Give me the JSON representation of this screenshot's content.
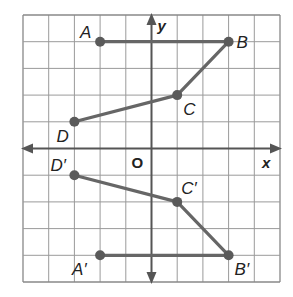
{
  "diagram": {
    "type": "coordinate-grid-reflection",
    "grid": {
      "xmin": -5,
      "xmax": 5,
      "ymin": -5,
      "ymax": 5,
      "step": 1
    },
    "axes": {
      "x_label": "x",
      "y_label": "y",
      "origin_label": "O"
    },
    "colors": {
      "grid": "#9a9a9a",
      "border": "#888888",
      "axis": "#555555",
      "figure": "#666666",
      "point": "#5a5a5a",
      "text": "#222222",
      "background": "#ffffff"
    },
    "figures": [
      {
        "name": "ABCD",
        "points": [
          {
            "label": "A",
            "x": -2,
            "y": 4
          },
          {
            "label": "B",
            "x": 3,
            "y": 4
          },
          {
            "label": "C",
            "x": 1,
            "y": 2
          },
          {
            "label": "D",
            "x": -3,
            "y": 1
          }
        ]
      },
      {
        "name": "A'B'C'D'",
        "points": [
          {
            "label": "A′",
            "x": -2,
            "y": -4
          },
          {
            "label": "B′",
            "x": 3,
            "y": -4
          },
          {
            "label": "C′",
            "x": 1,
            "y": -2
          },
          {
            "label": "D′",
            "x": -3,
            "y": -1
          }
        ]
      }
    ]
  }
}
